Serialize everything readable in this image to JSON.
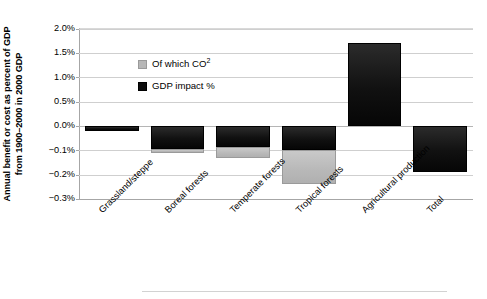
{
  "chart_data": {
    "type": "bar",
    "title": "",
    "subtitle": "",
    "xlabel": "",
    "ylabel": "Annual benefit or cost as percent of GDP\nfrom 1900–2000 in 2000 GDP",
    "categories": [
      "Grassland/steppe",
      "Boreal forests",
      "Temperate forests",
      "Tropical forests",
      "Agricultural production",
      "Total"
    ],
    "series": [
      {
        "name": "GDP impact %",
        "color": "#0d0d0d",
        "values": [
          -0.02,
          -0.095,
          -0.085,
          -0.1,
          1.7,
          -0.19
        ]
      },
      {
        "name": "Of which CO2",
        "color": "#b7b7b7",
        "values": [
          0.0,
          -0.11,
          -0.13,
          -0.24,
          0.0,
          0.0
        ]
      }
    ],
    "ytick_labels": [
      "2.0%",
      "1.5%",
      "1.0%",
      "0.5%",
      "0.0%",
      "−0.1%",
      "−0.2%",
      "−0.3%"
    ],
    "ytick_values": [
      2.0,
      1.5,
      1.0,
      0.5,
      0.0,
      -0.1,
      -0.2,
      -0.3
    ],
    "ylim": [
      -0.3,
      2.0
    ],
    "y_axis_note": "non-linear axis: equal spacing between listed ticks",
    "grid": true,
    "legend_position": "inside-upper-left",
    "legend": [
      {
        "label_prefix": "Of which CO",
        "label_sup": "2",
        "marker": "light-square-marker"
      },
      {
        "label_prefix": "GDP impact %",
        "label_sup": "",
        "marker": "dark-square-marker"
      }
    ]
  }
}
